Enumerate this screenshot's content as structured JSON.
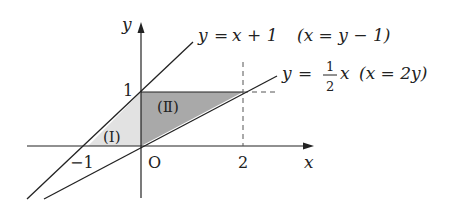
{
  "axes": {
    "x_label": "x",
    "y_label": "y",
    "origin_label": "O",
    "tick_labels": {
      "x_neg1": "−1",
      "x_2": "2",
      "y_1": "1"
    }
  },
  "lines": [
    {
      "id": "line1",
      "equation_lhs": "y",
      "equation_eq": "=",
      "equation_rhs": "x + 1",
      "alt_form": "(x = y − 1)"
    },
    {
      "id": "line2",
      "equation_lhs": "y",
      "equation_eq": "=",
      "frac_num": "1",
      "frac_den": "2",
      "frac_var": "x",
      "alt_form": "(x = 2y)"
    }
  ],
  "regions": [
    {
      "label": "(Ⅰ)",
      "fill": "#e0e0e0"
    },
    {
      "label": "(Ⅱ)",
      "fill": "#a8a8a8"
    }
  ],
  "colors": {
    "line": "#222222",
    "dashed": "#555555"
  }
}
